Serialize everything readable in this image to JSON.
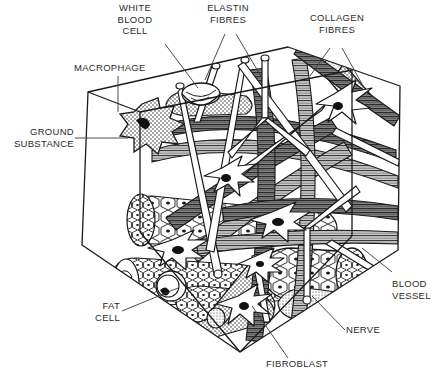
{
  "figure": {
    "background_color": "#ffffff",
    "ink_color": "#1a1a1a",
    "label_color": "#2b2b2b"
  },
  "labels": {
    "white_blood_cell": "WHITE\nBLOOD\nCELL",
    "elastin_fibres": "ELASTIN\nFIBRES",
    "collagen_fibres": "COLLAGEN\nFIBRES",
    "macrophage": "MACROPHAGE",
    "ground_substance": "GROUND\nSUBSTANCE",
    "fat_cell": "FAT\nCELL",
    "fibroblast": "FIBROBLAST",
    "nerve": "NERVE",
    "blood_vessel": "BLOOD\nVESSEL"
  },
  "structures": [
    {
      "name": "white-blood-cell",
      "description": "rounded cup-shaped leukocyte on top face"
    },
    {
      "name": "elastin-fibres",
      "description": "thin hollow branching tubes"
    },
    {
      "name": "collagen-fibres",
      "description": "thick striated fibre bundles"
    },
    {
      "name": "macrophage",
      "description": "star-shaped stippled cell"
    },
    {
      "name": "ground-substance",
      "description": "clear matrix filling the cube"
    },
    {
      "name": "fat-cell",
      "description": "honeycomb adipocyte clusters"
    },
    {
      "name": "fibroblast",
      "description": "elongated star cell with dark nucleus"
    },
    {
      "name": "nerve",
      "description": "stippled cylindrical bundle"
    },
    {
      "name": "blood-vessel",
      "description": "large stippled tube"
    }
  ]
}
